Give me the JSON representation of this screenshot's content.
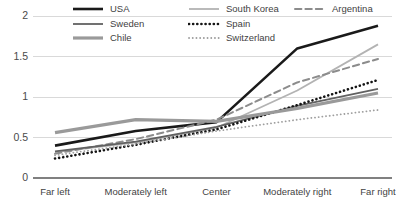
{
  "chart_data": {
    "type": "line",
    "title": "",
    "xlabel": "",
    "ylabel": "",
    "categories": [
      "Far left",
      "Moderately left",
      "Center",
      "Moderately right",
      "Far right"
    ],
    "ylim": [
      0,
      2
    ],
    "yticks": [
      "0",
      "0.5",
      "1",
      "1.5",
      "2"
    ],
    "ytick_values": [
      0,
      0.5,
      1,
      1.5,
      2
    ],
    "grid": true,
    "legend_position": "top",
    "series": [
      {
        "name": "USA",
        "color": "#1a1a1a",
        "style": "solid",
        "width": 2.6,
        "values": [
          0.4,
          0.58,
          0.69,
          1.6,
          1.88
        ]
      },
      {
        "name": "South Korea",
        "color": "#b3b3b3",
        "style": "solid",
        "width": 1.8,
        "values": [
          0.32,
          0.44,
          0.62,
          1.08,
          1.65
        ]
      },
      {
        "name": "Argentina",
        "color": "#8c8c8c",
        "style": "dashed",
        "width": 2.0,
        "values": [
          0.3,
          0.48,
          0.72,
          1.18,
          1.47
        ]
      },
      {
        "name": "Sweden",
        "color": "#616161",
        "style": "solid",
        "width": 1.8,
        "values": [
          0.33,
          0.45,
          0.63,
          0.89,
          1.1
        ]
      },
      {
        "name": "Spain",
        "color": "#141414",
        "style": "dotted-thick",
        "width": 2.6,
        "values": [
          0.24,
          0.41,
          0.6,
          0.9,
          1.21
        ]
      },
      {
        "name": "Chile",
        "color": "#9a9a9a",
        "style": "solid-thick",
        "width": 3.2,
        "values": [
          0.56,
          0.72,
          0.7,
          0.86,
          1.05
        ]
      },
      {
        "name": "Switzerland",
        "color": "#9e9e9e",
        "style": "dotted-fine",
        "width": 1.8,
        "values": [
          0.28,
          0.42,
          0.58,
          0.72,
          0.84
        ]
      }
    ]
  },
  "legend": {
    "items": [
      {
        "label": "USA",
        "row": 0,
        "col": 0
      },
      {
        "label": "South Korea",
        "row": 0,
        "col": 1
      },
      {
        "label": "Argentina",
        "row": 0,
        "col": 2
      },
      {
        "label": "Sweden",
        "row": 1,
        "col": 0
      },
      {
        "label": "Spain",
        "row": 1,
        "col": 1
      },
      {
        "label": "Chile",
        "row": 2,
        "col": 0
      },
      {
        "label": "Switzerland",
        "row": 2,
        "col": 1
      }
    ]
  },
  "axes": {
    "grid_color": "#d9d9d9",
    "axis_color": "#808080",
    "text_color": "#3f3f3f"
  }
}
